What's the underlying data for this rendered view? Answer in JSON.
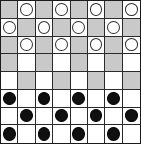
{
  "board": {
    "title": "Checkers Board",
    "rows": 8,
    "columns": 8,
    "light_color": "#ffffff",
    "dark_color": "#c9c9c9",
    "border_color": "#2a2a2a",
    "white_piece_color": "#ffffff",
    "white_piece_outline": "#303030",
    "black_piece_color": "#101010",
    "black_piece_outline": "#000000",
    "white_piece_count": 12,
    "black_piece_count": 12,
    "empty_cell_count": 40,
    "grid": [
      [
        null,
        "white",
        null,
        "white",
        null,
        "white",
        null,
        "white"
      ],
      [
        "white",
        null,
        "white",
        null,
        "white",
        null,
        "white",
        null
      ],
      [
        null,
        "white",
        null,
        "white",
        null,
        "white",
        null,
        "white"
      ],
      [
        null,
        null,
        null,
        null,
        null,
        null,
        null,
        null
      ],
      [
        null,
        null,
        null,
        null,
        null,
        null,
        null,
        null
      ],
      [
        "black",
        null,
        "black",
        null,
        "black",
        null,
        "black",
        null
      ],
      [
        null,
        "black",
        null,
        "black",
        null,
        "black",
        null,
        "black"
      ],
      [
        "black",
        null,
        "black",
        null,
        "black",
        null,
        "black",
        null
      ]
    ],
    "shading": [
      [
        "dark",
        "light",
        "dark",
        "light",
        "dark",
        "light",
        "dark",
        "light"
      ],
      [
        "light",
        "dark",
        "light",
        "dark",
        "light",
        "dark",
        "light",
        "dark"
      ],
      [
        "dark",
        "light",
        "dark",
        "light",
        "dark",
        "light",
        "dark",
        "light"
      ],
      [
        "dark",
        "light",
        "dark",
        "light",
        "dark",
        "light",
        "dark",
        "light"
      ],
      [
        "light",
        "dark",
        "light",
        "dark",
        "light",
        "dark",
        "light",
        "dark"
      ],
      [
        "dark",
        "light",
        "dark",
        "light",
        "dark",
        "light",
        "dark",
        "light"
      ],
      [
        "light",
        "dark",
        "light",
        "dark",
        "light",
        "dark",
        "light",
        "dark"
      ],
      [
        "dark",
        "light",
        "dark",
        "light",
        "dark",
        "light",
        "dark",
        "light"
      ]
    ]
  }
}
